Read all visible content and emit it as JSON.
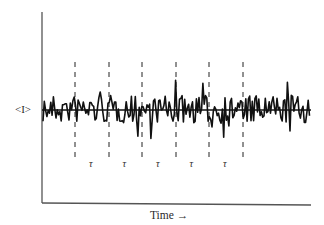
{
  "chart_data": {
    "type": "line",
    "title": "",
    "xlabel": "Time →",
    "ylabel": "<I>",
    "mean_label": "<I>",
    "interval_label": "τ",
    "interval_count": 5,
    "grid": false,
    "legend": null,
    "annotations": [
      {
        "type": "horizontal-line",
        "meaning": "mean intensity <I>"
      },
      {
        "type": "dashed-vertical-lines",
        "count": 6,
        "meaning": "boundaries of equal time intervals τ"
      }
    ]
  },
  "axes": {
    "x_label": "Time →",
    "y_label": "<I>"
  },
  "intervals": {
    "labels": [
      "τ",
      "τ",
      "τ",
      "τ",
      "τ"
    ]
  },
  "colors": {
    "ink": "#111111",
    "axis": "#555555",
    "background": "#ffffff"
  }
}
